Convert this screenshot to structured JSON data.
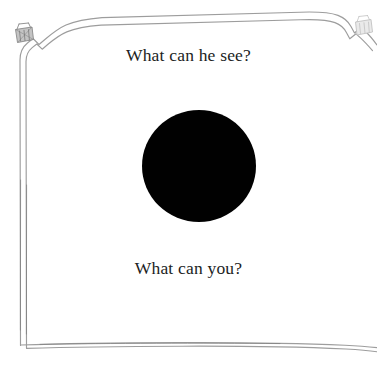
{
  "page": {
    "type": "picture-book-page",
    "background_color": "#ffffff",
    "width": 377,
    "height": 367
  },
  "frame": {
    "name": "hand-drawn-double-line-border",
    "line_color": "#9a9a9a",
    "line_color_dark": "#6f6f6f",
    "style": "double wavy ink line with notched top corners"
  },
  "captions": {
    "top": "What can he see?",
    "bottom": "What can you?",
    "text_color": "#211e1e"
  },
  "illustration": {
    "shape": "circle",
    "label": "large black circle",
    "fill_color": "#010101",
    "center_x": 199,
    "center_y": 166,
    "diameter": 113
  },
  "ornaments": [
    {
      "name": "basket-icon",
      "position": "top-left",
      "color": "#8d8d8d"
    },
    {
      "name": "basket-icon",
      "position": "top-right",
      "color": "#c9c9c9"
    }
  ]
}
